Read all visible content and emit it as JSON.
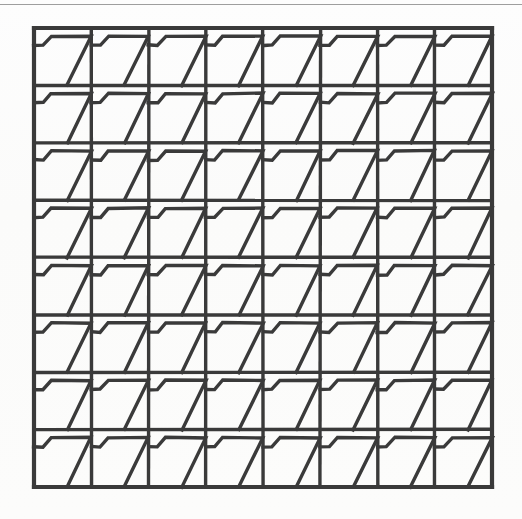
{
  "figure": {
    "caption": "",
    "background_color": "#fdfdfd",
    "ink_color": "#3a3a3a",
    "page_rule_color": "#8d8d8d"
  },
  "grid": {
    "rows": 8,
    "columns": 8,
    "cell_count": 64,
    "origin_x": 34,
    "origin_y": 28,
    "width": 458,
    "height": 459,
    "cell_width": 57.25,
    "cell_height": 57.375,
    "line_width": 3.4,
    "outer_border_width": 4.2
  },
  "motif": {
    "name": "flag-trapezoid",
    "description": "Horizontal stub from the left edge rising to a long horizontal bar at one quarter height that runs to the right edge, then a diagonal descending to the lower right corner of the cell.",
    "stroke_width": 3.4,
    "stroke_color": "#3a3a3a",
    "fill": "none",
    "points_normalized": [
      [
        0.0,
        0.3
      ],
      [
        0.16,
        0.3
      ],
      [
        0.3,
        0.14
      ],
      [
        1.0,
        0.14
      ],
      [
        0.58,
        1.0
      ]
    ]
  },
  "chart_data": {
    "type": "table",
    "xlabel": "",
    "ylabel": "",
    "categories": [
      "col 1",
      "col 2",
      "col 3",
      "col 4",
      "col 5",
      "col 6",
      "col 7",
      "col 8"
    ],
    "rows": [
      "row 1",
      "row 2",
      "row 3",
      "row 4",
      "row 5",
      "row 6",
      "row 7",
      "row 8"
    ],
    "values": [
      [
        1,
        1,
        1,
        1,
        1,
        1,
        1,
        1
      ],
      [
        1,
        1,
        1,
        1,
        1,
        1,
        1,
        1
      ],
      [
        1,
        1,
        1,
        1,
        1,
        1,
        1,
        1
      ],
      [
        1,
        1,
        1,
        1,
        1,
        1,
        1,
        1
      ],
      [
        1,
        1,
        1,
        1,
        1,
        1,
        1,
        1
      ],
      [
        1,
        1,
        1,
        1,
        1,
        1,
        1,
        1
      ],
      [
        1,
        1,
        1,
        1,
        1,
        1,
        1,
        1
      ],
      [
        1,
        1,
        1,
        1,
        1,
        1,
        1,
        1
      ]
    ],
    "legend": [
      "flag-trapezoid motif"
    ],
    "grid": true
  }
}
